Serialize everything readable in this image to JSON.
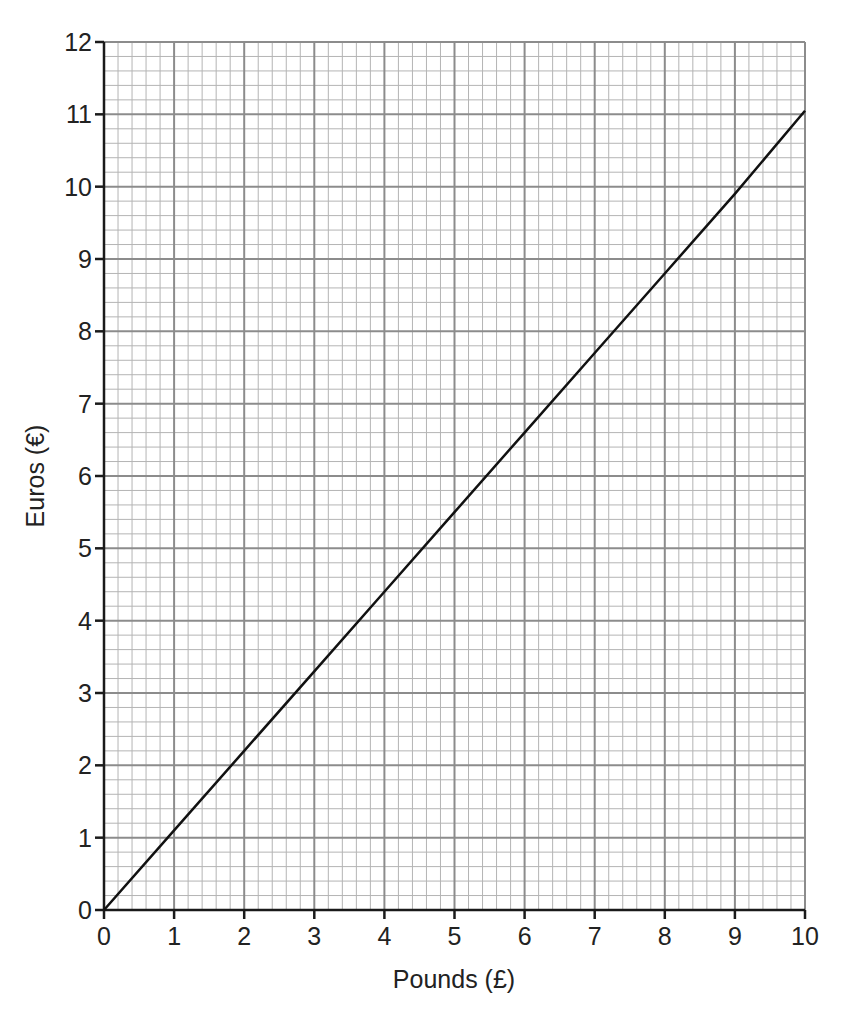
{
  "chart_data": {
    "type": "line",
    "title": "",
    "xlabel": "Pounds (£)",
    "ylabel": "Euros (€)",
    "xlim": [
      0,
      10
    ],
    "ylim": [
      0,
      12
    ],
    "x_ticks": [
      "0",
      "1",
      "2",
      "3",
      "4",
      "5",
      "6",
      "7",
      "8",
      "9",
      "10"
    ],
    "y_ticks": [
      "0",
      "1",
      "2",
      "3",
      "4",
      "5",
      "6",
      "7",
      "8",
      "9",
      "10",
      "11",
      "12"
    ],
    "minor_subdivisions": 5,
    "grid": true,
    "legend": null,
    "series": [
      {
        "name": "Pounds to Euros conversion",
        "x": [
          0,
          1,
          2,
          3,
          4,
          5,
          6,
          7,
          8,
          9,
          10
        ],
        "values": [
          0,
          1.1,
          2.2,
          3.3,
          4.4,
          5.5,
          6.6,
          7.7,
          8.8,
          9.9,
          11.05
        ]
      }
    ]
  },
  "colors": {
    "major_grid": "#8c8c8c",
    "minor_grid": "#b4b4b4",
    "axis": "#1a1a1a",
    "line": "#111111",
    "text": "#222222"
  }
}
